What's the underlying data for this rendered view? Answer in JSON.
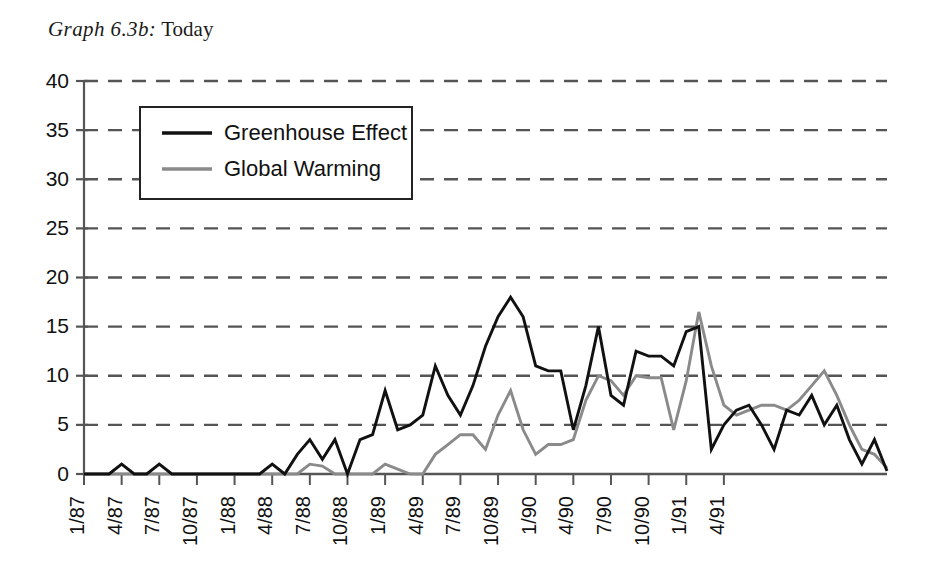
{
  "title": {
    "prefix": "Graph 6.3b:",
    "text": "Today"
  },
  "legend": {
    "position": "inside-top-left",
    "items": [
      {
        "label": "Greenhouse Effect",
        "color": "#111111"
      },
      {
        "label": "Global Warming",
        "color": "#8a8a8a"
      }
    ]
  },
  "colors": {
    "series_greenhouse": "#111111",
    "series_global_warming": "#8a8a8a",
    "gridline": "#555555",
    "axis": "#555555",
    "text": "#111111",
    "background": "#ffffff"
  },
  "chart_data": {
    "type": "line",
    "xlabel": "",
    "ylabel": "",
    "ylim": [
      0,
      40
    ],
    "ytick_labels": [
      "0",
      "5",
      "10",
      "15",
      "20",
      "25",
      "30",
      "35",
      "40"
    ],
    "ytick_values": [
      0,
      5,
      10,
      15,
      20,
      25,
      30,
      35,
      40
    ],
    "grid": true,
    "grid_style": "dashed-horizontal",
    "legend_position": "upper left inside",
    "x": [
      "1/87",
      "2/87",
      "3/87",
      "4/87",
      "5/87",
      "6/87",
      "7/87",
      "8/87",
      "9/87",
      "10/87",
      "11/87",
      "12/87",
      "1/88",
      "2/88",
      "3/88",
      "4/88",
      "5/88",
      "6/88",
      "7/88",
      "8/88",
      "9/88",
      "10/88",
      "11/88",
      "12/88",
      "1/89",
      "2/89",
      "3/89",
      "4/89",
      "5/89",
      "6/89",
      "7/89",
      "8/89",
      "9/89",
      "10/89",
      "11/89",
      "12/89",
      "1/90",
      "2/90",
      "3/90",
      "4/90",
      "5/90",
      "6/90",
      "7/90",
      "8/90",
      "9/90",
      "10/90",
      "11/90",
      "12/90",
      "1/91",
      "2/91",
      "3/91",
      "4/91",
      "5/91"
    ],
    "xtick_labels": [
      "1/87",
      "4/87",
      "7/87",
      "10/87",
      "1/88",
      "4/88",
      "7/88",
      "10/88",
      "1/89",
      "4/89",
      "7/89",
      "10/89",
      "1/90",
      "4/90",
      "7/90",
      "10/90",
      "1/91",
      "4/91"
    ],
    "xtick_indices": [
      0,
      3,
      6,
      9,
      12,
      15,
      18,
      21,
      24,
      27,
      30,
      33,
      36,
      39,
      42,
      45,
      48,
      51
    ],
    "xtick_rotation": -90,
    "series": [
      {
        "name": "Greenhouse Effect",
        "color": "#111111",
        "values": [
          0,
          0,
          0,
          1,
          0,
          0,
          1,
          0,
          0,
          0,
          0,
          0,
          0,
          0,
          0,
          1,
          0,
          2,
          3.5,
          1.5,
          3.5,
          0,
          3.5,
          4,
          8.5,
          4.5,
          5,
          6,
          11,
          8,
          6,
          9,
          13,
          16,
          18,
          16,
          11,
          10.5,
          10.5,
          4.5,
          9,
          15,
          8,
          7,
          12.5,
          12,
          12,
          11,
          14.5,
          15,
          2.5,
          5,
          6.5
        ]
      },
      {
        "name": "Global Warming",
        "color": "#8a8a8a",
        "values": [
          0,
          0,
          0,
          0,
          0,
          0,
          0,
          0,
          0,
          0,
          0,
          0,
          0,
          0,
          0,
          0,
          0,
          0,
          1,
          0.8,
          0,
          0,
          0,
          0,
          1,
          0.5,
          0,
          0,
          2,
          3,
          4,
          4,
          2.5,
          6,
          8.5,
          4.5,
          2,
          3,
          3,
          3.5,
          7.5,
          10,
          9.5,
          8,
          10,
          9.8,
          9.8,
          4.5,
          9.5,
          16.5,
          11,
          7,
          6
        ]
      }
    ],
    "series_tail": {
      "note": "values continue to end of plot",
      "greenhouse": [
        7,
        5,
        2.5,
        6.5,
        6,
        8,
        5,
        7,
        3.5,
        1,
        3.5,
        0.3
      ],
      "global_warming": [
        6.5,
        7,
        7,
        6.5,
        7.5,
        9,
        10.5,
        8,
        5,
        2.5,
        2,
        0.6
      ]
    }
  },
  "plot_geometry": {
    "left": 84,
    "right": 887,
    "top": 81,
    "bottom": 474
  }
}
